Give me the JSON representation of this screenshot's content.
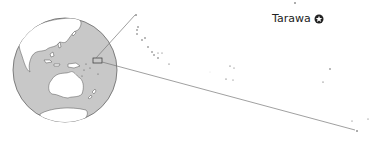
{
  "map": {
    "title": "Kiribati locator map",
    "capital": {
      "name": "Tarawa",
      "icon": "capital-star-circle-icon"
    },
    "colors": {
      "ocean": "#c8c8c8",
      "land": "#ffffff",
      "coast": "#555555",
      "leader_line": "#666666",
      "islands": "#444444"
    },
    "globe": {
      "cx": 65,
      "cy": 70,
      "r": 52
    },
    "highlight_box": {
      "x": 93,
      "y": 58,
      "w": 9,
      "h": 5
    },
    "leader_lines": [
      {
        "x1": 96,
        "y1": 58,
        "x2": 135,
        "y2": 15
      },
      {
        "x1": 102,
        "y1": 62,
        "x2": 355,
        "y2": 130
      }
    ]
  }
}
